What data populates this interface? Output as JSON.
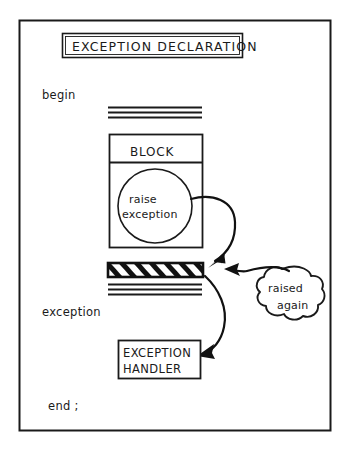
{
  "figure": {
    "kind": "flow-diagram",
    "title_box": {
      "label": "EXCEPTION DECLARATION"
    },
    "keywords": {
      "begin": "begin",
      "exception": "exception",
      "end": "end ;"
    },
    "block": {
      "header": "BLOCK",
      "circle_line1": "raise",
      "circle_line2": "exception"
    },
    "handler_box": {
      "line1": "EXCEPTION",
      "line2": "HANDLER"
    },
    "cloud": {
      "line1": "raised",
      "line2": "again"
    },
    "colors": {
      "ink": "#1a1a1a",
      "paper": "#ffffff",
      "hatch": "#111111"
    }
  }
}
